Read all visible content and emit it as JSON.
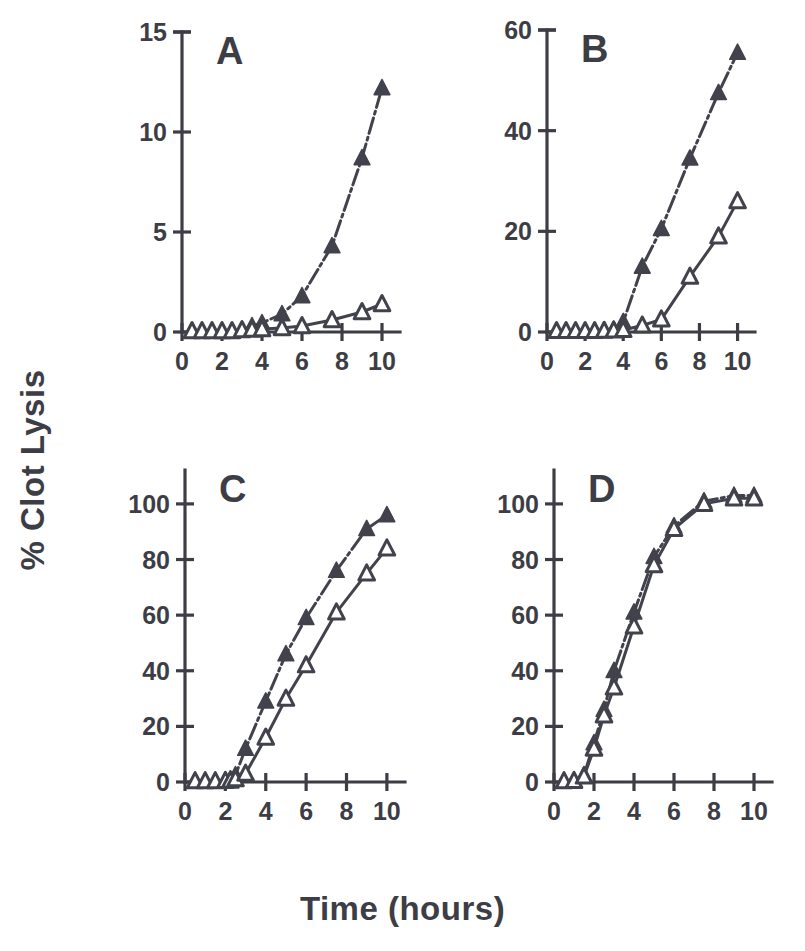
{
  "figure": {
    "ylabel": "% Clot Lysis",
    "xlabel": "Time (hours)",
    "ink_color": "#42424c",
    "background_color": "#ffffff"
  },
  "chart_data": [
    {
      "type": "line",
      "panel": "A",
      "title": "A",
      "xlabel": "Time (hours)",
      "ylabel": "% Clot Lysis",
      "xlim": [
        0,
        10.6
      ],
      "ylim": [
        0,
        15
      ],
      "xticks": [
        0,
        2,
        4,
        6,
        8,
        10
      ],
      "xtick_labels": [
        "0",
        "2",
        "4",
        "6",
        "8",
        "10"
      ],
      "yticks": [
        0,
        5,
        10,
        15
      ],
      "ytick_labels": [
        "0",
        "5",
        "10",
        "15"
      ],
      "grid": false,
      "legend": "none",
      "series": [
        {
          "name": "filled-triangle",
          "marker": "filled-triangle",
          "linestyle": "dash-dot",
          "x": [
            0.5,
            1.0,
            1.5,
            2.0,
            2.5,
            3.0,
            3.5,
            4.0,
            5.0,
            6.0,
            7.5,
            9.0,
            10.0
          ],
          "y": [
            0.05,
            0.05,
            0.05,
            0.05,
            0.05,
            0.1,
            0.3,
            0.45,
            0.9,
            1.8,
            4.3,
            8.7,
            12.2
          ]
        },
        {
          "name": "open-triangle",
          "marker": "open-triangle",
          "linestyle": "solid",
          "x": [
            0.5,
            1.0,
            1.5,
            2.0,
            2.5,
            3.0,
            3.5,
            4.0,
            5.0,
            6.0,
            7.5,
            9.0,
            10.0
          ],
          "y": [
            0.05,
            0.05,
            0.05,
            0.05,
            0.05,
            0.1,
            0.12,
            0.15,
            0.2,
            0.3,
            0.6,
            1.0,
            1.4
          ]
        }
      ]
    },
    {
      "type": "line",
      "panel": "B",
      "title": "B",
      "xlabel": "Time (hours)",
      "ylabel": "% Clot Lysis",
      "xlim": [
        0,
        10.6
      ],
      "ylim": [
        0,
        60
      ],
      "xticks": [
        0,
        2,
        4,
        6,
        8,
        10
      ],
      "xtick_labels": [
        "0",
        "2",
        "4",
        "6",
        "8",
        "10"
      ],
      "yticks": [
        0,
        20,
        40,
        60
      ],
      "ytick_labels": [
        "0",
        "20",
        "40",
        "60"
      ],
      "grid": false,
      "legend": "none",
      "series": [
        {
          "name": "filled-triangle",
          "marker": "filled-triangle",
          "linestyle": "dash-dot",
          "x": [
            0.5,
            1.0,
            1.5,
            2.0,
            2.5,
            3.0,
            3.5,
            4.0,
            5.0,
            6.0,
            7.5,
            9.0,
            10.0
          ],
          "y": [
            0.2,
            0.2,
            0.2,
            0.2,
            0.2,
            0.3,
            0.5,
            2.0,
            13.0,
            20.5,
            34.5,
            47.5,
            55.5
          ]
        },
        {
          "name": "open-triangle",
          "marker": "open-triangle",
          "linestyle": "solid",
          "x": [
            0.5,
            1.0,
            1.5,
            2.0,
            2.5,
            3.0,
            3.5,
            4.0,
            5.0,
            6.0,
            7.5,
            9.0,
            10.0
          ],
          "y": [
            0.2,
            0.2,
            0.2,
            0.2,
            0.2,
            0.25,
            0.3,
            0.4,
            1.3,
            2.5,
            11.0,
            19.0,
            26.0
          ]
        }
      ]
    },
    {
      "type": "line",
      "panel": "C",
      "title": "C",
      "xlabel": "Time (hours)",
      "ylabel": "% Clot Lysis",
      "xlim": [
        0,
        10.6
      ],
      "ylim": [
        0,
        105
      ],
      "xticks": [
        0,
        2,
        4,
        6,
        8,
        10
      ],
      "xtick_labels": [
        "0",
        "2",
        "4",
        "6",
        "8",
        "10"
      ],
      "yticks": [
        0,
        20,
        40,
        60,
        80,
        100
      ],
      "ytick_labels": [
        "0",
        "20",
        "40",
        "60",
        "80",
        "100"
      ],
      "grid": false,
      "legend": "none",
      "series": [
        {
          "name": "filled-triangle",
          "marker": "filled-triangle",
          "linestyle": "dash-dot",
          "x": [
            0.5,
            1.0,
            1.5,
            2.0,
            2.25,
            2.5,
            3.0,
            4.0,
            5.0,
            6.0,
            7.5,
            9.0,
            10.0
          ],
          "y": [
            0.3,
            0.3,
            0.3,
            0.5,
            1.0,
            2.5,
            12.0,
            29.0,
            46.0,
            59.0,
            76.0,
            91.0,
            96.0
          ]
        },
        {
          "name": "open-triangle",
          "marker": "open-triangle",
          "linestyle": "solid",
          "x": [
            0.5,
            1.0,
            1.5,
            2.0,
            2.25,
            2.5,
            3.0,
            4.0,
            5.0,
            6.0,
            7.5,
            9.0,
            10.0
          ],
          "y": [
            0.3,
            0.3,
            0.3,
            0.4,
            0.5,
            1.0,
            3.0,
            16.0,
            30.0,
            42.0,
            61.0,
            75.0,
            84.0
          ]
        }
      ]
    },
    {
      "type": "line",
      "panel": "D",
      "title": "D",
      "xlabel": "Time (hours)",
      "ylabel": "% Clot Lysis",
      "xlim": [
        0,
        10.6
      ],
      "ylim": [
        0,
        105
      ],
      "xticks": [
        0,
        2,
        4,
        6,
        8,
        10
      ],
      "xtick_labels": [
        "0",
        "2",
        "4",
        "6",
        "8",
        "10"
      ],
      "yticks": [
        0,
        20,
        40,
        60,
        80,
        100
      ],
      "ytick_labels": [
        "0",
        "20",
        "40",
        "60",
        "80",
        "100"
      ],
      "grid": false,
      "legend": "none",
      "series": [
        {
          "name": "filled-triangle",
          "marker": "filled-triangle",
          "linestyle": "dash-dot",
          "x": [
            0.5,
            1.0,
            1.5,
            2.0,
            2.5,
            3.0,
            4.0,
            5.0,
            6.0,
            7.5,
            9.0,
            10.0
          ],
          "y": [
            0.3,
            0.5,
            2.5,
            14.0,
            26.0,
            40.0,
            61.0,
            81.0,
            92.0,
            101.0,
            103.0,
            103.0
          ]
        },
        {
          "name": "open-triangle",
          "marker": "open-triangle",
          "linestyle": "solid",
          "x": [
            0.5,
            1.0,
            1.5,
            2.0,
            2.5,
            3.0,
            4.0,
            5.0,
            6.0,
            7.5,
            9.0,
            10.0
          ],
          "y": [
            0.3,
            0.4,
            2.0,
            12.0,
            24.0,
            34.0,
            56.0,
            78.0,
            91.0,
            100.0,
            102.0,
            102.0
          ]
        }
      ]
    }
  ],
  "panels": {
    "A": {
      "letter": "A"
    },
    "B": {
      "letter": "B"
    },
    "C": {
      "letter": "C"
    },
    "D": {
      "letter": "D"
    }
  }
}
